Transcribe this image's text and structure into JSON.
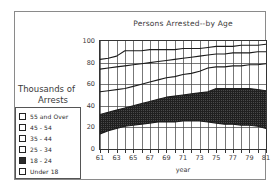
{
  "window": {
    "background": "#ffffff",
    "frame_color": "#8a8a8a"
  },
  "legend": {
    "title_line1": "Thousands of",
    "title_line2": "Arrests",
    "items": [
      {
        "label": "55 and Over",
        "swatch": "empty-checkbox-icon",
        "fill": "#ffffff"
      },
      {
        "label": "45 - 54",
        "swatch": "empty-checkbox-icon",
        "fill": "#ffffff"
      },
      {
        "label": "35 - 44",
        "swatch": "empty-checkbox-icon",
        "fill": "#ffffff"
      },
      {
        "label": "25 - 34",
        "swatch": "empty-checkbox-icon",
        "fill": "#ffffff"
      },
      {
        "label": "18 - 24",
        "swatch": "filled-checkbox-icon",
        "fill": "#2b2b2b"
      },
      {
        "label": "Under 18",
        "swatch": "empty-checkbox-icon",
        "fill": "#ffffff"
      }
    ]
  },
  "chart_data": {
    "type": "area",
    "title": "Persons Arrested--by Age",
    "xlabel": "year",
    "ylabel": "Thousands of Arrests",
    "xlim": [
      61,
      81
    ],
    "ylim": [
      0,
      100
    ],
    "grid": true,
    "legend_position": "left",
    "x": [
      61,
      62,
      63,
      64,
      65,
      66,
      67,
      68,
      69,
      70,
      71,
      72,
      73,
      74,
      75,
      76,
      77,
      78,
      79,
      80,
      81
    ],
    "xticks": [
      61,
      63,
      65,
      67,
      69,
      71,
      73,
      75,
      77,
      79,
      81
    ],
    "xticklabels": [
      "61",
      "63",
      "65",
      "67",
      "69",
      "71",
      "73",
      "75",
      "77",
      "79",
      "81"
    ],
    "yticks": [
      0,
      20,
      40,
      60,
      80,
      100
    ],
    "yticklabels": [
      "0",
      "20",
      "40",
      "60",
      "80",
      "100"
    ],
    "note": "Cumulative stacked boundary curves, bottom to top. Values are cumulative percent-of-total style running from 0 at the axis upward.",
    "series": [
      {
        "name": "Under 18",
        "swatch": "#ffffff",
        "cumulative_upper": [
          14,
          17,
          19,
          21,
          22,
          23,
          24,
          25,
          25,
          25,
          26,
          26,
          26,
          25,
          24,
          23,
          23,
          22,
          22,
          21,
          19
        ]
      },
      {
        "name": "18 - 24",
        "swatch": "#2b2b2b",
        "cumulative_upper": [
          32,
          34,
          36,
          38,
          40,
          42,
          44,
          46,
          48,
          49,
          50,
          51,
          52,
          53,
          56,
          56,
          56,
          56,
          56,
          55,
          54
        ]
      },
      {
        "name": "25 - 34",
        "swatch": "#ffffff",
        "cumulative_upper": [
          53,
          54,
          55,
          56,
          58,
          60,
          62,
          64,
          66,
          67,
          69,
          70,
          72,
          75,
          76,
          76,
          77,
          77,
          78,
          78,
          79
        ]
      },
      {
        "name": "35 - 44",
        "swatch": "#ffffff",
        "cumulative_upper": [
          74,
          75,
          76,
          77,
          78,
          79,
          80,
          81,
          82,
          83,
          84,
          85,
          86,
          87,
          88,
          88,
          89,
          89,
          89,
          90,
          90
        ]
      },
      {
        "name": "45 - 54",
        "swatch": "#ffffff",
        "cumulative_upper": [
          83,
          84,
          86,
          91,
          91,
          91,
          92,
          92,
          92,
          92,
          93,
          93,
          93,
          94,
          95,
          95,
          95,
          96,
          96,
          96,
          97
        ]
      },
      {
        "name": "55 and Over",
        "swatch": "#ffffff",
        "cumulative_upper": [
          100,
          100,
          100,
          100,
          100,
          100,
          100,
          100,
          100,
          100,
          100,
          100,
          100,
          100,
          100,
          100,
          100,
          100,
          100,
          100,
          100
        ]
      }
    ]
  }
}
